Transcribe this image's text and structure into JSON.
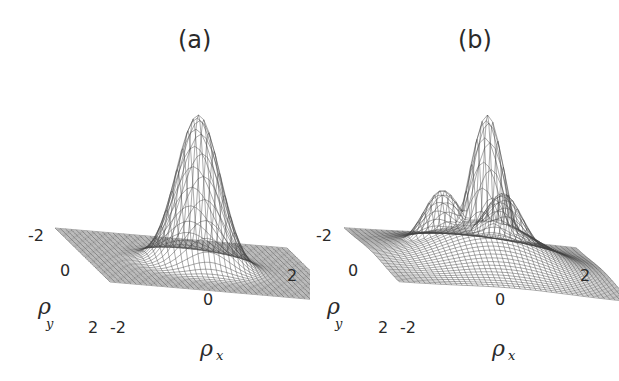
{
  "figure": {
    "panels": [
      {
        "id": "a",
        "title": "(a)",
        "type": "3d-surface-wireframe",
        "description": "single central Gaussian-like peak on flat plane",
        "x_axis": {
          "label": "ρ",
          "subscript": "x",
          "ticks": [
            "-2",
            "0",
            "2"
          ]
        },
        "y_axis": {
          "label": "ρ",
          "subscript": "y",
          "ticks": [
            "-2",
            "0",
            "2"
          ]
        }
      },
      {
        "id": "b",
        "title": "(b)",
        "type": "3d-surface-wireframe",
        "description": "central peak with two side lobes and broad base",
        "x_axis": {
          "label": "ρ",
          "subscript": "x",
          "ticks": [
            "-2",
            "0",
            "2"
          ]
        },
        "y_axis": {
          "label": "ρ",
          "subscript": "y",
          "ticks": [
            "-2",
            "0",
            "2"
          ]
        }
      }
    ]
  },
  "chart_data": [
    {
      "type": "surface",
      "title": "(a)",
      "xlabel": "ρx",
      "ylabel": "ρy",
      "xlim": [
        -2,
        2
      ],
      "ylim": [
        -2,
        2
      ],
      "x_ticks": [
        -2,
        0,
        2
      ],
      "y_ticks": [
        -2,
        0,
        2
      ],
      "shape": "single narrow peak centered at (0,0), flat elsewhere"
    },
    {
      "type": "surface",
      "title": "(b)",
      "xlabel": "ρx",
      "ylabel": "ρy",
      "xlim": [
        -2,
        2
      ],
      "ylim": [
        -2,
        2
      ],
      "x_ticks": [
        -2,
        0,
        2
      ],
      "y_ticks": [
        -2,
        0,
        2
      ],
      "shape": "tall central peak with two smaller side lobes on broad hump"
    }
  ]
}
